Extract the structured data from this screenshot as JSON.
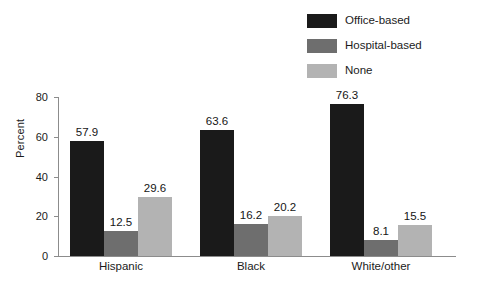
{
  "chart_data": {
    "type": "bar",
    "title": "",
    "xlabel": "",
    "ylabel": "Percent",
    "ylim": [
      0,
      80
    ],
    "yticks": [
      "0",
      "20",
      "40",
      "60",
      "80"
    ],
    "grid": false,
    "legend_position": "top-right",
    "categories": [
      "Hispanic",
      "Black",
      "White/other"
    ],
    "series": [
      {
        "name": "Office-based",
        "color": "#1a1a1a",
        "values": [
          57.9,
          63.6,
          76.3
        ],
        "labels": [
          "57.9",
          "63.6",
          "76.3"
        ]
      },
      {
        "name": "Hospital-based",
        "color": "#6e6e6e",
        "values": [
          12.5,
          16.2,
          8.1
        ],
        "labels": [
          "12.5",
          "16.2",
          "8.1"
        ]
      },
      {
        "name": "None",
        "color": "#b3b3b3",
        "values": [
          29.6,
          20.2,
          15.5
        ],
        "labels": [
          "29.6",
          "20.2",
          "15.5"
        ]
      }
    ]
  },
  "legend": {
    "items": [
      {
        "label": "Office-based",
        "color": "#1a1a1a"
      },
      {
        "label": "Hospital-based",
        "color": "#6e6e6e"
      },
      {
        "label": "None",
        "color": "#b3b3b3"
      }
    ]
  },
  "axis": {
    "y_title": "Percent",
    "y_ticks": [
      "80",
      "60",
      "40",
      "20",
      "0"
    ]
  },
  "colors": {
    "axis_line": "#8c8c8c",
    "text": "#1b1b1b",
    "background": "#ffffff"
  }
}
